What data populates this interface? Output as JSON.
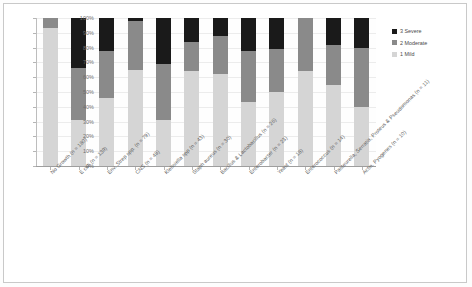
{
  "chart_data": {
    "type": "bar",
    "stacked": true,
    "stack_mode": "percent",
    "title": "",
    "xlabel": "",
    "ylabel": "",
    "ylim": [
      0,
      100
    ],
    "grid": true,
    "legend_position": "right",
    "y_ticks": [
      "0%",
      "10%",
      "20%",
      "30%",
      "40%",
      "50%",
      "60%",
      "70%",
      "80%",
      "90%",
      "100%"
    ],
    "y_tick_values": [
      0,
      10,
      20,
      30,
      40,
      50,
      60,
      70,
      80,
      90,
      100
    ],
    "categories": [
      "No Growth (n = 180)",
      "E coli (n = 139)",
      "Env. Strep spp. (n = 79)",
      "CNS (n = 48)",
      "Klebsiella spp (n = 43)",
      "Staph aureus (n = 30)",
      "Bacillus & Lactobacillus (n = 26)",
      "Enterobacter (n = 23)",
      "Yeast (n = 18)",
      "Enterococcus (n = 14)",
      "Pasteurella, Serratia, Proteus & Pseudomonas (n = 11)",
      "Actin. Pyogenes (n = 10)"
    ],
    "series": [
      {
        "name": "1 Mild",
        "color": "#d5d5d5",
        "values": [
          93,
          31,
          46,
          65,
          31,
          64,
          62,
          43,
          50,
          64,
          55,
          40
        ]
      },
      {
        "name": "2 Moderate",
        "color": "#8a8a8a",
        "values": [
          7,
          35,
          32,
          33,
          38,
          20,
          26,
          35,
          29,
          36,
          27,
          40
        ]
      },
      {
        "name": "3 Severe",
        "color": "#1a1a1a",
        "values": [
          0,
          34,
          22,
          2,
          31,
          16,
          12,
          22,
          21,
          0,
          18,
          20
        ]
      }
    ]
  },
  "legend": {
    "items": [
      {
        "label": "3 Severe",
        "color": "#1a1a1a"
      },
      {
        "label": "2 Moderate",
        "color": "#8a8a8a"
      },
      {
        "label": "1 Mild",
        "color": "#d5d5d5"
      }
    ]
  }
}
